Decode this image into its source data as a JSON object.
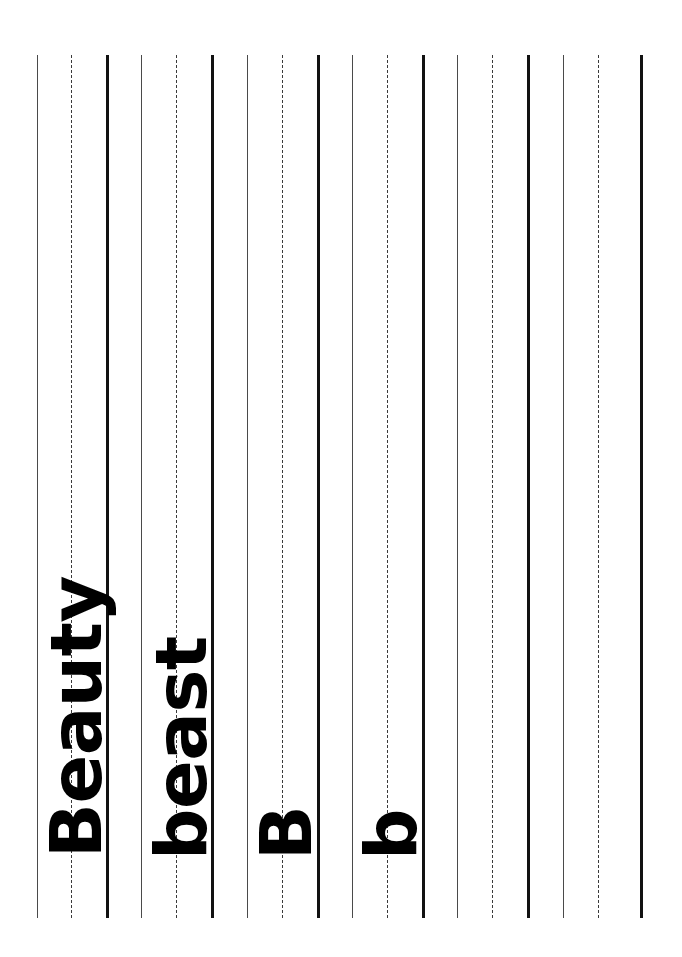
{
  "document": {
    "type": "handwriting-practice-worksheet",
    "orientation": "rotated-90-counterclockwise",
    "page_background": "#ffffff",
    "ink_color": "#000000",
    "width_px": 682,
    "height_px": 957
  },
  "guide_lines": {
    "group_pattern": [
      "baseline",
      "midline",
      "topline"
    ],
    "line_start_y": 55,
    "line_end_y": 918,
    "styles": {
      "baseline": {
        "kind": "solid-thin",
        "color": "#4a4a4a",
        "width_px": 1.4
      },
      "midline": {
        "kind": "dashed-thin",
        "color": "#3a3a3a",
        "width_px": 1.6
      },
      "topline": {
        "kind": "solid-thick",
        "color": "#121212",
        "width_px": 3.2
      }
    },
    "lines": [
      {
        "index": 0,
        "x": 37,
        "style": "baseline"
      },
      {
        "index": 1,
        "x": 71,
        "style": "midline"
      },
      {
        "index": 2,
        "x": 106,
        "style": "topline"
      },
      {
        "index": 3,
        "x": 141,
        "style": "baseline"
      },
      {
        "index": 4,
        "x": 176,
        "style": "midline"
      },
      {
        "index": 5,
        "x": 211,
        "style": "topline"
      },
      {
        "index": 6,
        "x": 247,
        "style": "baseline"
      },
      {
        "index": 7,
        "x": 282,
        "style": "midline"
      },
      {
        "index": 8,
        "x": 317,
        "style": "topline"
      },
      {
        "index": 9,
        "x": 352,
        "style": "baseline"
      },
      {
        "index": 10,
        "x": 387,
        "style": "midline"
      },
      {
        "index": 11,
        "x": 422,
        "style": "topline"
      },
      {
        "index": 12,
        "x": 457,
        "style": "baseline"
      },
      {
        "index": 13,
        "x": 492,
        "style": "midline"
      },
      {
        "index": 14,
        "x": 527,
        "style": "topline"
      },
      {
        "index": 15,
        "x": 563,
        "style": "baseline"
      },
      {
        "index": 16,
        "x": 598,
        "style": "midline"
      },
      {
        "index": 17,
        "x": 640,
        "style": "topline"
      }
    ]
  },
  "handwriting": {
    "entries": [
      {
        "id": "beauty",
        "text": "Beauty",
        "row": 1
      },
      {
        "id": "beast",
        "text": "beast",
        "row": 2
      },
      {
        "id": "B",
        "text": "B",
        "row": 3
      },
      {
        "id": "b",
        "text": "b",
        "row": 4
      }
    ]
  }
}
